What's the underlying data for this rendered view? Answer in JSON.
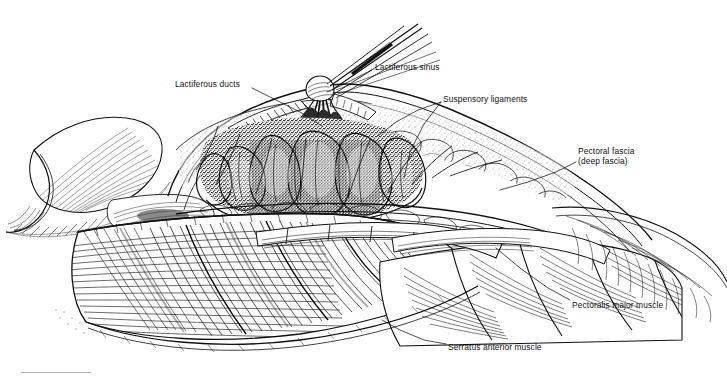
{
  "figure": {
    "domain": "anatomical-line-illustration",
    "background_color": "#ffffff",
    "ink_color": "#111111",
    "width": 727,
    "height": 376
  },
  "labels": [
    {
      "id": "lactiferous-ducts",
      "text": "Lactiferous ducts",
      "x": 175,
      "y": 79,
      "align": "left",
      "leader": [
        [
          252,
          88
        ],
        [
          268,
          96
        ],
        [
          300,
          112
        ],
        [
          322,
          126
        ]
      ]
    },
    {
      "id": "lactiferous-sinus",
      "text": "Lactiferous sinus",
      "x": 375,
      "y": 62,
      "align": "left",
      "leader": [
        [
          372,
          70
        ],
        [
          356,
          78
        ],
        [
          340,
          86
        ],
        [
          327,
          92
        ]
      ]
    },
    {
      "id": "suspensory-ligaments",
      "text": "Suspensory ligaments",
      "x": 443,
      "y": 94,
      "align": "left",
      "leader": [
        [
          441,
          102
        ],
        [
          424,
          124
        ],
        [
          410,
          152
        ],
        [
          404,
          178
        ]
      ]
    },
    {
      "id": "suspensory-ligaments-branch",
      "text": "",
      "leader": [
        [
          441,
          102
        ],
        [
          418,
          110
        ],
        [
          396,
          122
        ],
        [
          378,
          136
        ]
      ]
    },
    {
      "id": "pectoral-fascia",
      "text": "Pectoral fascia\n(deep fascia)",
      "x": 578,
      "y": 146,
      "align": "left",
      "leader": [
        [
          576,
          162
        ],
        [
          556,
          172
        ],
        [
          528,
          182
        ],
        [
          500,
          190
        ]
      ]
    },
    {
      "id": "pectoralis-major-muscle",
      "text": "Pectoralis major muscle",
      "x": 572,
      "y": 300,
      "align": "left",
      "leader": [
        [
          570,
          300
        ],
        [
          548,
          288
        ],
        [
          520,
          268
        ],
        [
          496,
          248
        ]
      ]
    },
    {
      "id": "serratus-anterior-muscle",
      "text": "Serratus anterior muscle",
      "x": 448,
      "y": 342,
      "align": "left",
      "leader": [
        [
          446,
          344
        ],
        [
          424,
          340
        ],
        [
          400,
          330
        ],
        [
          382,
          320
        ]
      ]
    }
  ],
  "footer": {
    "rule_visible": true,
    "rule_color": "#b4b4b4"
  }
}
